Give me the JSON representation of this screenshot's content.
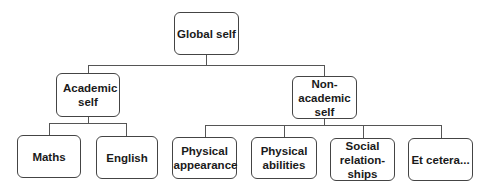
{
  "diagram": {
    "type": "hierarchy",
    "root": {
      "label": "Global self"
    },
    "level1": [
      {
        "label": "Academic self"
      },
      {
        "label": "Non-academic self",
        "label_lines": [
          "Non-",
          "academic",
          "self"
        ]
      }
    ],
    "level2": [
      {
        "label": "Maths",
        "parent": "Academic self"
      },
      {
        "label": "English",
        "parent": "Academic self"
      },
      {
        "label": "Physical appearance",
        "parent": "Non-academic self"
      },
      {
        "label": "Physical abilities",
        "parent": "Non-academic self"
      },
      {
        "label": "Social relationships",
        "label_lines": [
          "Social",
          "relation-",
          "ships"
        ],
        "parent": "Non-academic self"
      },
      {
        "label": "Et cetera...",
        "parent": "Non-academic self"
      }
    ],
    "colors": {
      "border": "#444444",
      "line": "#555555",
      "text": "#1a1a1a",
      "background": "#ffffff"
    }
  }
}
